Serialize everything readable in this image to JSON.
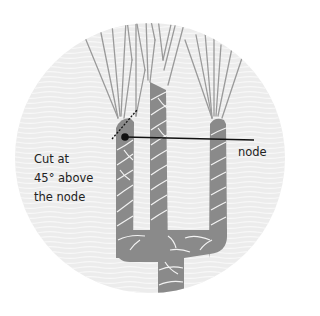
{
  "diagram": {
    "labels": {
      "cut_line1": "Cut at",
      "cut_line2": "45° above",
      "cut_line3": "the node",
      "node": "node"
    },
    "colors": {
      "background": "#ffffff",
      "circle": "#eeeeee",
      "circle_lines": "#f7f7f7",
      "stem": "#8a8a8a",
      "stem_pattern": "#f2f2f2",
      "leaf_lines": "#999999",
      "pointer": "#111111",
      "text": "#222222"
    }
  }
}
